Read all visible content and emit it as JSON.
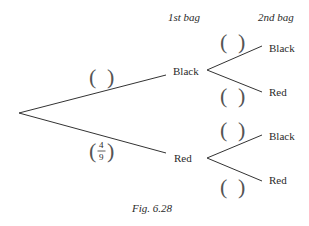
{
  "headers": {
    "first": "1st bag",
    "second": "2nd bag"
  },
  "first_level": [
    {
      "label": "Black",
      "probability": ""
    },
    {
      "label": "Red",
      "probability_num": "4",
      "probability_den": "9"
    }
  ],
  "second_level": [
    {
      "parent": "Black",
      "label": "Black",
      "probability": ""
    },
    {
      "parent": "Black",
      "label": "Red",
      "probability": ""
    },
    {
      "parent": "Red",
      "label": "Black",
      "probability": ""
    },
    {
      "parent": "Red",
      "label": "Red",
      "probability": ""
    }
  ],
  "bracket": {
    "open": "(",
    "close": ")"
  },
  "caption": "Fig. 6.28"
}
